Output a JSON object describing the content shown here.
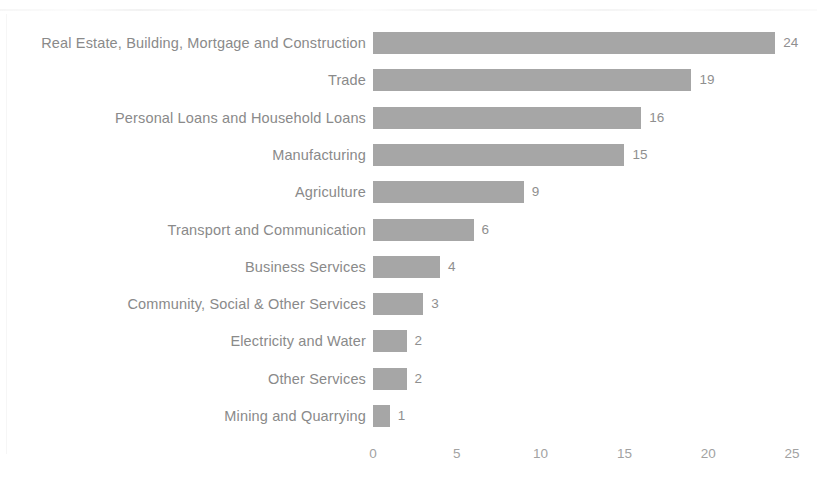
{
  "chart_data": {
    "type": "bar",
    "orientation": "horizontal",
    "title": "",
    "subtitle": "",
    "xlabel": "",
    "ylabel": "",
    "xlim": [
      0,
      25
    ],
    "xticks": [
      "0",
      "5",
      "10",
      "15",
      "20",
      "25"
    ],
    "grid": false,
    "legend": false,
    "bar_color": "#a6a6a6",
    "label_color": "#8a8a8a",
    "tick_color": "#a2a2a2",
    "background_color": "#ffffff",
    "show_data_labels": true,
    "categories": [
      "Real Estate, Building, Mortgage and Construction",
      "Trade",
      "Personal Loans and Household Loans",
      "Manufacturing",
      "Agriculture",
      "Transport and Communication",
      "Business Services",
      "Community, Social & Other Services",
      "Electricity and Water",
      "Other Services",
      "Mining and Quarrying"
    ],
    "values": [
      24,
      19,
      16,
      15,
      9,
      6,
      4,
      3,
      2,
      2,
      1
    ],
    "data_labels": [
      "24",
      "19",
      "16",
      "15",
      "9",
      "6",
      "4",
      "3",
      "2",
      "2",
      "1"
    ]
  }
}
